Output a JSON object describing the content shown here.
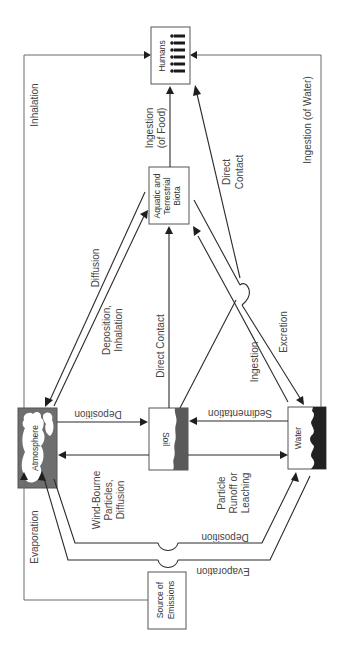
{
  "diagram": {
    "colors": {
      "line": "#2a2a2a",
      "border_line": "#6a6a6a",
      "box_border": "#555555",
      "atmosphere_fill": "#6e6e6e",
      "soil_fill": "#5a5a5a",
      "water_fill": "#222222",
      "label_text": "#444444"
    },
    "nodes": {
      "humans": {
        "label": "Humans",
        "icon": "people-icon"
      },
      "biota": {
        "line1": "Aquatic and",
        "line2": "Terrestrial",
        "line3": "Biota"
      },
      "atmosphere": {
        "label": "Atmosphere",
        "icon": "cloud-icon"
      },
      "soil": {
        "label": "Soil",
        "icon": "soil-layer-icon"
      },
      "water": {
        "label": "Water",
        "icon": "wave-icon"
      },
      "source": {
        "line1": "Source of",
        "line2": "Emissions"
      }
    },
    "edges": {
      "inhalation": "Inhalation",
      "ingestion_food_1": "Ingestion",
      "ingestion_food_2": "(of Food)",
      "ingestion_water": "Ingestion (of Water)",
      "direct_contact_humans_1": "Direct",
      "direct_contact_humans_2": "Contact",
      "diffusion": "Diffusion",
      "deposition_inhalation_1": "Deposition,",
      "deposition_inhalation_2": "Inhalation",
      "direct_contact_soil": "Direct Contact",
      "ingestion_water_biota": "Ingestion",
      "excretion": "Excretion",
      "deposition_atm_soil": "Deposition",
      "sedimentation": "Sedimentation",
      "windborne_1": "Wind-Bourne",
      "windborne_2": "Particles,",
      "windborne_3": "Diffusion",
      "runoff_1": "Particle",
      "runoff_2": "Runoff or",
      "runoff_3": "Leaching",
      "deposition_atm_water": "Deposition",
      "evaporation_water_atm": "Evaporation",
      "evaporation_source": "Evaporation"
    }
  }
}
